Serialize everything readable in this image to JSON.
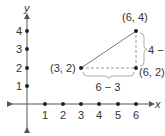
{
  "diagram": {
    "type": "coordinate-plane",
    "axes": {
      "x_label": "x",
      "y_label": "y",
      "x_ticks": [
        "1",
        "2",
        "3",
        "4",
        "5",
        "6"
      ],
      "y_ticks": [
        "1",
        "2",
        "3",
        "4"
      ]
    },
    "points": [
      {
        "label": "(3, 2)",
        "x": 3,
        "y": 2
      },
      {
        "label": "(6, 4)",
        "x": 6,
        "y": 4
      },
      {
        "label": "(6, 2)",
        "x": 6,
        "y": 2
      }
    ],
    "segments": [
      {
        "from": "(3, 2)",
        "to": "(6, 4)",
        "style": "solid"
      },
      {
        "from": "(3, 2)",
        "to": "(6, 2)",
        "style": "dashed"
      },
      {
        "from": "(6, 2)",
        "to": "(6, 4)",
        "style": "dashed"
      }
    ],
    "annotations": {
      "horizontal_run": "6 − 3",
      "vertical_rise": "4 − 2"
    },
    "colors": {
      "axis": "#555555",
      "line": "#777777",
      "point": "#222222",
      "text": "#333333"
    }
  }
}
